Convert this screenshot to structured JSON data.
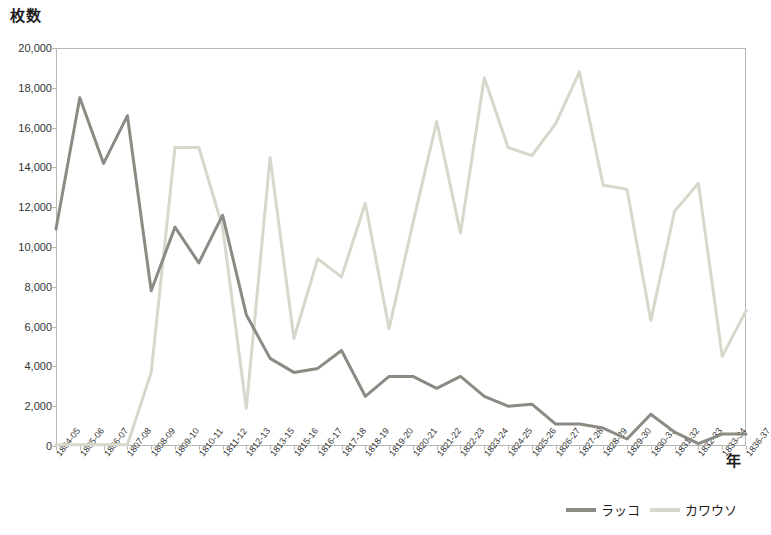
{
  "chart_data": {
    "type": "line",
    "title": "",
    "xlabel": "年",
    "ylabel": "枚数",
    "ylim": [
      0,
      20000
    ],
    "ytick_step": 2000,
    "grid": false,
    "legend_position": "bottom-right",
    "categories": [
      "1804-05",
      "1805-06",
      "1806-07",
      "1807-08",
      "1808-09",
      "1809-10",
      "1810-11",
      "1811-12",
      "1812-13",
      "1813-15",
      "1815-16",
      "1816-17",
      "1817-18",
      "1818-19",
      "1819-20",
      "1820-21",
      "1821-22",
      "1822-23",
      "1823-24",
      "1824-25",
      "1825-26",
      "1826-27",
      "1827-28",
      "1828-29",
      "1829-30",
      "1830-31",
      "1831-32",
      "1832-33",
      "1833-34",
      "1836-37"
    ],
    "yticks": [
      "0",
      "2,000",
      "4,000",
      "6,000",
      "8,000",
      "10,000",
      "12,000",
      "14,000",
      "16,000",
      "18,000",
      "20,000"
    ],
    "series": [
      {
        "name": "ラッコ",
        "color": "#8b8b84",
        "values": [
          10900,
          17500,
          14200,
          16600,
          7800,
          11000,
          9200,
          11600,
          6600,
          4400,
          3700,
          3900,
          4800,
          2500,
          3500,
          3500,
          2900,
          3500,
          2500,
          2000,
          2100,
          1100,
          1100,
          900,
          350,
          1600,
          700,
          120,
          600,
          600
        ]
      },
      {
        "name": "カワウソ",
        "color": "#d8d7cc",
        "values": [
          60,
          60,
          60,
          60,
          3700,
          15000,
          15000,
          11000,
          1900,
          14500,
          5400,
          9400,
          8500,
          12200,
          5900,
          11200,
          16300,
          10700,
          18500,
          15000,
          14600,
          16200,
          18800,
          13100,
          12900,
          6300,
          11800,
          13200,
          4500,
          6800
        ]
      }
    ]
  },
  "legend": {
    "items": [
      {
        "label": "ラッコ",
        "color": "#8b8b84"
      },
      {
        "label": "カワウソ",
        "color": "#d8d7cc"
      }
    ]
  },
  "axes": {
    "y_title": "枚数",
    "x_title": "年"
  }
}
